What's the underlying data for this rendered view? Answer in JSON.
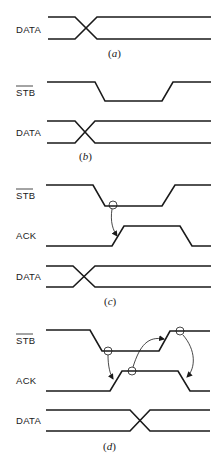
{
  "figure": {
    "panels": [
      {
        "id": "a",
        "caption_open": "(",
        "caption_letter": "a",
        "caption_close": ")",
        "signals": [
          {
            "name": "DATA",
            "overbar": false
          }
        ]
      },
      {
        "id": "b",
        "caption_open": "(",
        "caption_letter": "b",
        "caption_close": ")",
        "signals": [
          {
            "name": "STB",
            "overbar": true
          },
          {
            "name": "DATA",
            "overbar": false
          }
        ]
      },
      {
        "id": "c",
        "caption_open": "(",
        "caption_letter": "c",
        "caption_close": ")",
        "signals": [
          {
            "name": "STB",
            "overbar": true
          },
          {
            "name": "ACK",
            "overbar": false
          },
          {
            "name": "DATA",
            "overbar": false
          }
        ],
        "causal_arrows": [
          {
            "from": "STB falling edge",
            "to": "ACK rising edge"
          }
        ]
      },
      {
        "id": "d",
        "caption_open": "(",
        "caption_letter": "d",
        "caption_close": ")",
        "signals": [
          {
            "name": "STB",
            "overbar": true
          },
          {
            "name": "ACK",
            "overbar": false
          },
          {
            "name": "DATA",
            "overbar": false
          }
        ],
        "causal_arrows": [
          {
            "from": "STB falling edge",
            "to": "ACK rising edge"
          },
          {
            "from": "ACK rising edge",
            "to": "STB rising edge"
          },
          {
            "from": "STB rising edge",
            "to": "ACK falling edge"
          }
        ]
      }
    ]
  }
}
